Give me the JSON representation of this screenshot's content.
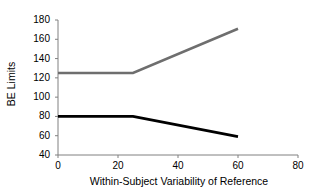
{
  "chart_data": {
    "type": "line",
    "title": "",
    "xlabel": "Within-Subject Variability of Reference",
    "ylabel": "BE Limits",
    "xlim": [
      0,
      80
    ],
    "ylim": [
      40,
      180
    ],
    "xticks": [
      0,
      20,
      40,
      60,
      80
    ],
    "yticks": [
      40,
      60,
      80,
      100,
      120,
      140,
      160,
      180
    ],
    "xtick_labels": [
      "0",
      "20",
      "40",
      "60",
      "80"
    ],
    "ytick_labels": [
      "40",
      "60",
      "80",
      "100",
      "120",
      "140",
      "160",
      "180"
    ],
    "grid": false,
    "legend": false,
    "series": [
      {
        "name": "Upper BE Limit",
        "color": "#6e6e6e",
        "width": 2.6,
        "x": [
          0,
          25,
          60
        ],
        "values": [
          125,
          125,
          171
        ]
      },
      {
        "name": "Lower BE Limit",
        "color": "#000000",
        "width": 2.8,
        "x": [
          0,
          25,
          60
        ],
        "values": [
          80,
          80,
          59
        ]
      }
    ]
  },
  "axes": {
    "axis_color": "#808080",
    "tick_color": "#808080",
    "label_color": "#000000"
  }
}
